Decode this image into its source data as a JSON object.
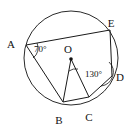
{
  "figure": {
    "type": "circle-geometry-diagram",
    "canvas": {
      "width": 135,
      "height": 130
    },
    "circle": {
      "label": "circle",
      "center_x": 71,
      "center_y": 58,
      "radius": 47,
      "color": "#2a2a2a"
    },
    "points": [
      {
        "id": "A",
        "label": "A",
        "x": 26,
        "y": 45,
        "label_x": 11,
        "label_y": 48,
        "on_circle": true,
        "dot": false
      },
      {
        "id": "B",
        "label": "B",
        "x": 63,
        "y": 102,
        "label_x": 59,
        "label_y": 124,
        "on_circle": true,
        "dot": false
      },
      {
        "id": "C",
        "label": "C",
        "x": 89,
        "y": 97,
        "label_x": 89,
        "label_y": 121,
        "on_circle": true,
        "dot": false
      },
      {
        "id": "D",
        "label": "D",
        "x": 112,
        "y": 76,
        "label_x": 118,
        "label_y": 81,
        "on_circle": true,
        "dot": false
      },
      {
        "id": "E",
        "label": "E",
        "x": 110,
        "y": 30,
        "label_x": 110,
        "label_y": 27,
        "on_circle": true,
        "dot": false
      },
      {
        "id": "O",
        "label": "O",
        "x": 71,
        "y": 59,
        "label_x": 66,
        "label_y": 54,
        "on_circle": false,
        "dot": true
      }
    ],
    "segments": [
      {
        "name": "segment-AE",
        "from": "A",
        "to": "E"
      },
      {
        "name": "segment-AB",
        "from": "A",
        "to": "B"
      },
      {
        "name": "segment-BC",
        "from": "B",
        "to": "C"
      },
      {
        "name": "segment-CD",
        "from": "C",
        "to": "D"
      },
      {
        "name": "segment-DE",
        "from": "D",
        "to": "E"
      },
      {
        "name": "segment-OB",
        "from": "O",
        "to": "B"
      },
      {
        "name": "segment-OC",
        "from": "O",
        "to": "C"
      }
    ],
    "angles": [
      {
        "name": "angle-at-A",
        "vertex": "A",
        "value": "70",
        "label": "70°",
        "label_x": 33,
        "label_y": 52
      },
      {
        "name": "angle-at-D",
        "vertex": "D",
        "value": "130",
        "label": "130°",
        "label_x": 85,
        "label_y": 77
      },
      {
        "name": "angle-at-O",
        "vertex": "O",
        "value": "",
        "label": "",
        "label_x": 0,
        "label_y": 0
      }
    ],
    "colors": {
      "ink": "#111111",
      "line": "#1a1a1a",
      "circle": "#2a2a2a",
      "background": "#ffffff"
    }
  }
}
